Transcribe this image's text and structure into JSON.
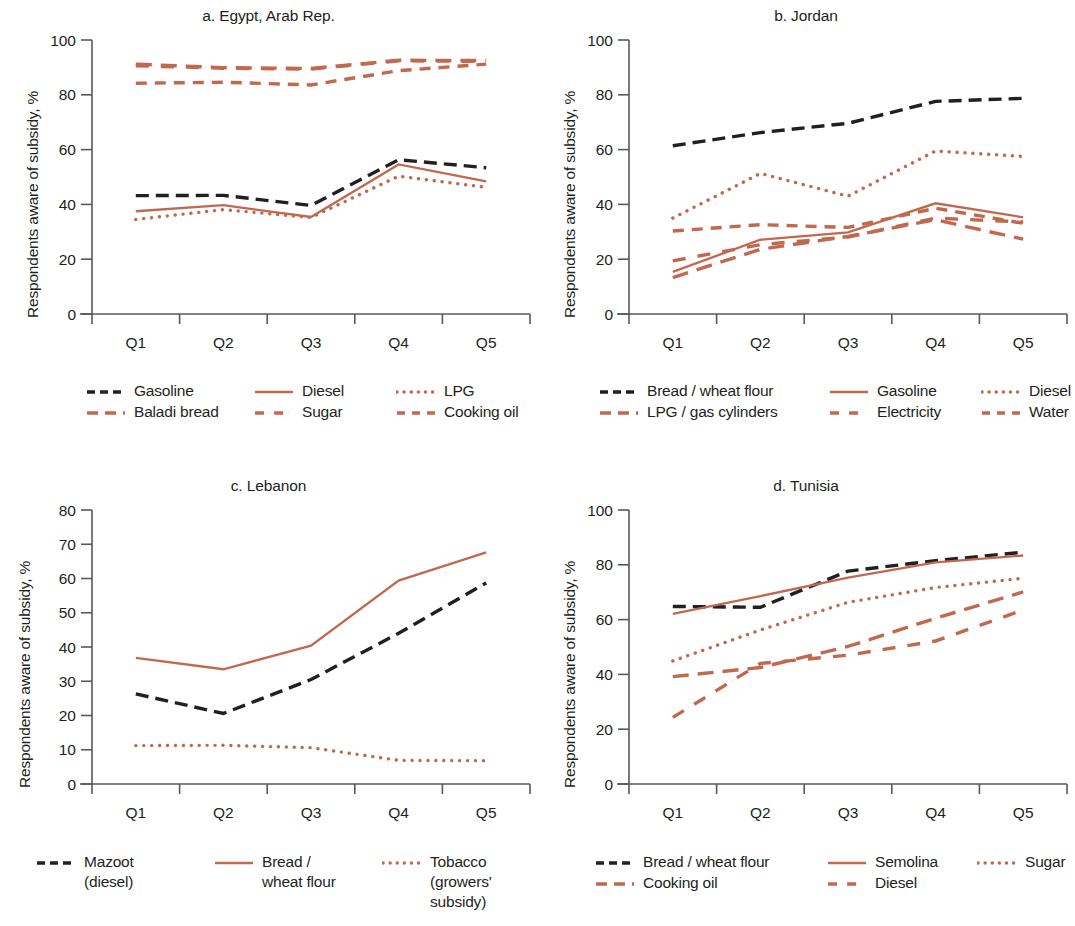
{
  "figure": {
    "colors": {
      "dark": "#231f20",
      "accent": "#c1694f",
      "axis": "#58595b",
      "background": "#ffffff"
    },
    "y_axis_label": "Respondents aware of subsidy, %",
    "categories": [
      "Q1",
      "Q2",
      "Q3",
      "Q4",
      "Q5"
    ]
  },
  "panels": [
    {
      "id": "egypt",
      "title": "a. Egypt, Arab Rep.",
      "legend_rows": 2,
      "legend_cols": 3
    },
    {
      "id": "jordan",
      "title": "b. Jordan",
      "legend_rows": 2,
      "legend_cols": 3
    },
    {
      "id": "lebanon",
      "title": "c. Lebanon",
      "legend_rows": 1,
      "legend_cols": 3
    },
    {
      "id": "tunisia",
      "title": "d. Tunisia",
      "legend_rows": 2,
      "legend_cols": 3
    }
  ],
  "chart_data": [
    {
      "id": "egypt",
      "type": "line",
      "title": "a. Egypt, Arab Rep.",
      "xlabel": "",
      "ylabel": "Respondents aware of subsidy, %",
      "categories": [
        "Q1",
        "Q2",
        "Q3",
        "Q4",
        "Q5"
      ],
      "ylim": [
        0,
        100
      ],
      "yticks": [
        0,
        20,
        40,
        60,
        80,
        100
      ],
      "grid": false,
      "legend_position": "below",
      "series": [
        {
          "name": "Gasoline",
          "values": [
            43.2,
            43.3,
            39.6,
            56.3,
            53.4
          ],
          "color": "#231f20",
          "dash": "dashed"
        },
        {
          "name": "Diesel",
          "values": [
            37.5,
            39.7,
            35.4,
            54.6,
            48.4
          ],
          "color": "#c1694f",
          "dash": "solid"
        },
        {
          "name": "LPG",
          "values": [
            34.5,
            38.1,
            35.2,
            50.3,
            46.2
          ],
          "color": "#c1694f",
          "dash": "dotted"
        },
        {
          "name": "Baladi bread",
          "values": [
            91.2,
            89.9,
            89.6,
            92.6,
            92.5
          ],
          "color": "#c1694f",
          "dash": "long-dash"
        },
        {
          "name": "Sugar",
          "values": [
            90.6,
            89.7,
            89.4,
            92.4,
            92.2
          ],
          "color": "#c1694f",
          "dash": "dash-dot"
        },
        {
          "name": "Cooking oil",
          "values": [
            84.2,
            84.6,
            83.6,
            88.8,
            91.2
          ],
          "color": "#c1694f",
          "dash": "dash-dash"
        }
      ]
    },
    {
      "id": "jordan",
      "type": "line",
      "title": "b. Jordan",
      "xlabel": "",
      "ylabel": "Respondents aware of subsidy, %",
      "categories": [
        "Q1",
        "Q2",
        "Q3",
        "Q4",
        "Q5"
      ],
      "ylim": [
        0,
        100
      ],
      "yticks": [
        0,
        20,
        40,
        60,
        80,
        100
      ],
      "grid": false,
      "legend_position": "below",
      "series": [
        {
          "name": "Bread / wheat flour",
          "values": [
            61.4,
            66.2,
            69.6,
            77.6,
            78.7
          ],
          "color": "#231f20",
          "dash": "dashed"
        },
        {
          "name": "Gasoline",
          "values": [
            15.4,
            27.1,
            29.8,
            40.4,
            35.3
          ],
          "color": "#c1694f",
          "dash": "solid"
        },
        {
          "name": "Diesel",
          "values": [
            35.0,
            51.3,
            43.0,
            59.5,
            57.5
          ],
          "color": "#c1694f",
          "dash": "dotted"
        },
        {
          "name": "LPG / gas cylinders",
          "values": [
            13.3,
            23.6,
            28.3,
            34.4,
            27.3
          ],
          "color": "#c1694f",
          "dash": "long-dash"
        },
        {
          "name": "Electricity",
          "values": [
            19.4,
            25.3,
            28.1,
            35.0,
            33.6
          ],
          "color": "#c1694f",
          "dash": "dash-dot"
        },
        {
          "name": "Water",
          "values": [
            30.3,
            32.6,
            31.6,
            38.6,
            33.1
          ],
          "color": "#c1694f",
          "dash": "dash-dash"
        }
      ]
    },
    {
      "id": "lebanon",
      "type": "line",
      "title": "c. Lebanon",
      "xlabel": "",
      "ylabel": "Respondents aware of subsidy, %",
      "categories": [
        "Q1",
        "Q2",
        "Q3",
        "Q4",
        "Q5"
      ],
      "ylim": [
        0,
        80
      ],
      "yticks": [
        0,
        10,
        20,
        30,
        40,
        50,
        60,
        70,
        80
      ],
      "grid": false,
      "legend_position": "below",
      "series": [
        {
          "name": "Mazoot\n(diesel)",
          "values": [
            26.3,
            20.6,
            30.5,
            44.0,
            58.7
          ],
          "color": "#231f20",
          "dash": "dashed"
        },
        {
          "name": "Bread /\nwheat flour",
          "values": [
            36.8,
            33.5,
            40.4,
            59.4,
            67.6
          ],
          "color": "#c1694f",
          "dash": "solid"
        },
        {
          "name": "Tobacco\n(growers' subsidy)",
          "values": [
            11.2,
            11.3,
            10.6,
            6.9,
            6.8
          ],
          "color": "#c1694f",
          "dash": "dotted"
        }
      ]
    },
    {
      "id": "tunisia",
      "type": "line",
      "title": "d. Tunisia",
      "xlabel": "",
      "ylabel": "Respondents aware of subsidy, %",
      "categories": [
        "Q1",
        "Q2",
        "Q3",
        "Q4",
        "Q5"
      ],
      "ylim": [
        0,
        100
      ],
      "yticks": [
        0,
        20,
        40,
        60,
        80,
        100
      ],
      "grid": false,
      "legend_position": "below",
      "series": [
        {
          "name": "Bread / wheat flour",
          "values": [
            64.8,
            64.5,
            77.7,
            81.5,
            84.6
          ],
          "color": "#231f20",
          "dash": "dashed"
        },
        {
          "name": "Semolina",
          "values": [
            62.1,
            68.6,
            75.3,
            80.9,
            83.4
          ],
          "color": "#c1694f",
          "dash": "solid"
        },
        {
          "name": "Sugar",
          "values": [
            44.9,
            56.2,
            66.3,
            71.7,
            75.1
          ],
          "color": "#c1694f",
          "dash": "dotted"
        },
        {
          "name": "Cooking oil",
          "values": [
            39.2,
            42.5,
            50.2,
            60.5,
            70.1
          ],
          "color": "#c1694f",
          "dash": "long-dash"
        },
        {
          "name": "Diesel",
          "values": [
            24.3,
            44.0,
            47.0,
            52.2,
            63.5
          ],
          "color": "#c1694f",
          "dash": "dash-dot"
        }
      ]
    }
  ]
}
